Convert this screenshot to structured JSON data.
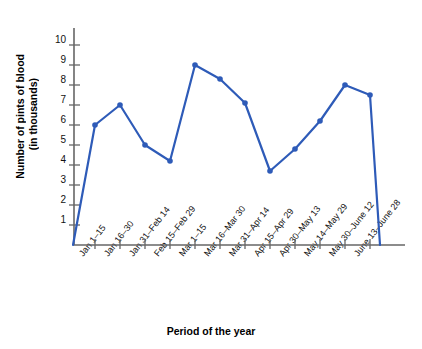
{
  "chart_data": {
    "type": "line",
    "title": "",
    "xlabel": "Period of the year",
    "ylabel": "Number of pints of blood (in thousands)",
    "ylabel_line1": "Number of pints of blood",
    "ylabel_line2": "(in thousands)",
    "ylim": [
      0,
      10.8
    ],
    "yticks": [
      1,
      2,
      3,
      4,
      5,
      6,
      7,
      8,
      9,
      10
    ],
    "ytick_labels": [
      "1",
      "2",
      "3",
      "4",
      "5",
      "6",
      "7",
      "8",
      "9",
      "10"
    ],
    "grid": false,
    "legend": null,
    "categories": [
      "Jan 1–15",
      "Jan 16–30",
      "Jan 31–Feb 14",
      "Feb 15–Feb 29",
      "Mar 1–15",
      "Mar 16–Mar 30",
      "Mar 31–Apr 14",
      "Apr 15–Apr 29",
      "Apr 30–May 13",
      "May 14–May 29",
      "May 30–June 12",
      "June 13–June 28"
    ],
    "values": [
      6.0,
      7.0,
      5.0,
      4.2,
      9.0,
      8.3,
      7.1,
      3.7,
      4.8,
      6.2,
      8.0,
      7.5
    ],
    "line_color": "#2E5BB8",
    "marker_color": "#2E5BB8",
    "axis_color": "#666666",
    "drops_to_zero_after_last_point": true
  }
}
